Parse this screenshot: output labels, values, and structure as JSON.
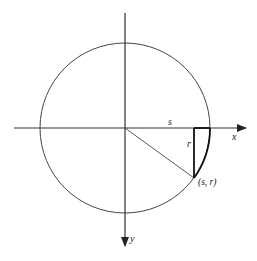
{
  "diagram": {
    "title": "",
    "colors": {
      "stroke": "#333333",
      "background": "#ffffff"
    },
    "origin": {
      "x": 125,
      "y": 128
    },
    "circle": {
      "radius": 85
    },
    "axes": {
      "x": {
        "label": "x",
        "direction": "right"
      },
      "y": {
        "label": "y",
        "direction": "down"
      }
    },
    "point": {
      "label": "(s, r)",
      "x": 194,
      "y": 178
    },
    "segments": {
      "horizontal": {
        "label": "s"
      },
      "vertical": {
        "label": "r"
      }
    }
  }
}
